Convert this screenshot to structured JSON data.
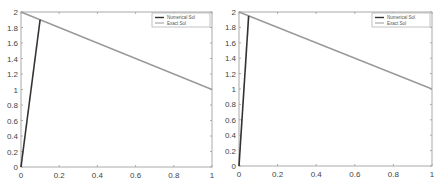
{
  "chart_data": [
    {
      "type": "line",
      "title": "",
      "xlabel": "",
      "ylabel": "",
      "xlim": [
        0,
        1
      ],
      "ylim": [
        0,
        2
      ],
      "xticks": [
        "0",
        "0.2",
        "0.4",
        "0.6",
        "0.8",
        "1"
      ],
      "yticks": [
        "0",
        "0.2",
        "0.4",
        "0.6",
        "0.8",
        "1",
        "1.2",
        "1.4",
        "1.6",
        "1.8",
        "2"
      ],
      "grid": false,
      "legend_position": "upper right",
      "series": [
        {
          "name": "Numerical Sol",
          "color": "#333333",
          "x": [
            0,
            0.1
          ],
          "y": [
            0,
            1.9
          ]
        },
        {
          "name": "Exact Sol",
          "color": "#999999",
          "x": [
            0,
            1
          ],
          "y": [
            2,
            1
          ]
        }
      ]
    },
    {
      "type": "line",
      "title": "",
      "xlabel": "",
      "ylabel": "",
      "xlim": [
        0,
        1
      ],
      "ylim": [
        0,
        2
      ],
      "xticks": [
        "0",
        "0.2",
        "0.4",
        "0.6",
        "0.8",
        "1"
      ],
      "yticks": [
        "0",
        "0.2",
        "0.4",
        "0.6",
        "0.8",
        "1",
        "1.2",
        "1.4",
        "1.6",
        "1.8",
        "2"
      ],
      "grid": false,
      "legend_position": "upper right",
      "series": [
        {
          "name": "Numerical Sol",
          "color": "#333333",
          "x": [
            0,
            0.05
          ],
          "y": [
            0,
            1.95
          ]
        },
        {
          "name": "Exact Sol",
          "color": "#999999",
          "x": [
            0,
            1
          ],
          "y": [
            2,
            1
          ]
        }
      ]
    }
  ]
}
